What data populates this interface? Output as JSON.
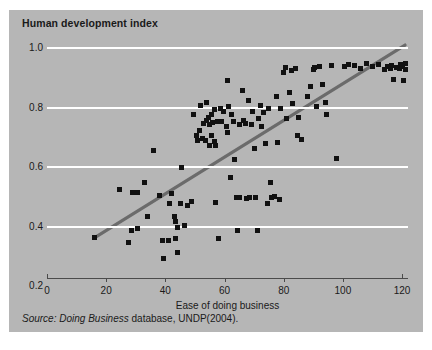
{
  "figure": {
    "title": "Human development index",
    "source_italic": "Source: Doing Business",
    "source_roman": " database, UNDP(2004).",
    "panel_color": "#b6b6b6",
    "grid_color": "#ffffff",
    "marker_color": "#111111",
    "trendline_color": "#6b6b6b",
    "axis_color": "#4b4b4b"
  },
  "chart_data": {
    "type": "scatter",
    "title": "Human development index",
    "xlabel": "Ease of doing business",
    "ylabel": "Human development index",
    "xlim": [
      0,
      122
    ],
    "ylim": [
      0.2,
      1.02
    ],
    "xticks": [
      0,
      20,
      40,
      60,
      80,
      100,
      120
    ],
    "xtick_labels": [
      "0",
      "20",
      "40",
      "60",
      "80",
      "100",
      "120"
    ],
    "yticks": [
      0.2,
      0.4,
      0.6,
      0.8,
      1.0
    ],
    "ytick_labels": [
      "0.2",
      "0.4",
      "0.6",
      "0.8",
      "1.0"
    ],
    "grid": "horizontal",
    "legend": "none",
    "annotation": "Source: Doing Business database, UNDP(2004).",
    "trendline": {
      "type": "linear",
      "x": [
        16,
        121
      ],
      "y": [
        0.362,
        1.01
      ]
    },
    "series": [
      {
        "name": "Countries",
        "marker": "square",
        "points": [
          [
            16.0,
            0.362
          ],
          [
            24.5,
            0.525
          ],
          [
            27.5,
            0.345
          ],
          [
            28.5,
            0.388
          ],
          [
            29.0,
            0.513
          ],
          [
            30.5,
            0.515
          ],
          [
            30.5,
            0.392
          ],
          [
            33.0,
            0.548
          ],
          [
            34.0,
            0.432
          ],
          [
            36.0,
            0.655
          ],
          [
            38.0,
            0.505
          ],
          [
            39.0,
            0.352
          ],
          [
            39.5,
            0.292
          ],
          [
            41.0,
            0.352
          ],
          [
            41.5,
            0.478
          ],
          [
            42.0,
            0.512
          ],
          [
            43.0,
            0.432
          ],
          [
            43.5,
            0.418
          ],
          [
            43.5,
            0.358
          ],
          [
            44.0,
            0.398
          ],
          [
            44.0,
            0.312
          ],
          [
            45.0,
            0.478
          ],
          [
            45.5,
            0.598
          ],
          [
            46.5,
            0.402
          ],
          [
            47.5,
            0.472
          ],
          [
            49.0,
            0.483
          ],
          [
            49.5,
            0.775
          ],
          [
            50.5,
            0.705
          ],
          [
            51.0,
            0.688
          ],
          [
            51.5,
            0.722
          ],
          [
            52.0,
            0.808
          ],
          [
            52.5,
            0.695
          ],
          [
            53.0,
            0.745
          ],
          [
            53.5,
            0.688
          ],
          [
            54.0,
            0.818
          ],
          [
            54.0,
            0.755
          ],
          [
            54.5,
            0.765
          ],
          [
            55.0,
            0.742
          ],
          [
            55.0,
            0.672
          ],
          [
            55.5,
            0.705
          ],
          [
            55.5,
            0.778
          ],
          [
            56.0,
            0.748
          ],
          [
            56.5,
            0.685
          ],
          [
            56.5,
            0.792
          ],
          [
            57.0,
            0.672
          ],
          [
            57.0,
            0.482
          ],
          [
            57.5,
            0.752
          ],
          [
            58.0,
            0.358
          ],
          [
            58.5,
            0.795
          ],
          [
            59.0,
            0.752
          ],
          [
            59.5,
            0.788
          ],
          [
            60.5,
            0.735
          ],
          [
            61.0,
            0.892
          ],
          [
            61.0,
            0.715
          ],
          [
            61.5,
            0.805
          ],
          [
            62.0,
            0.565
          ],
          [
            62.5,
            0.778
          ],
          [
            63.0,
            0.752
          ],
          [
            63.5,
            0.625
          ],
          [
            64.0,
            0.498
          ],
          [
            64.5,
            0.388
          ],
          [
            65.0,
            0.742
          ],
          [
            65.0,
            0.498
          ],
          [
            66.0,
            0.858
          ],
          [
            66.5,
            0.755
          ],
          [
            67.0,
            0.745
          ],
          [
            67.5,
            0.495
          ],
          [
            68.0,
            0.822
          ],
          [
            68.5,
            0.497
          ],
          [
            69.0,
            0.742
          ],
          [
            69.5,
            0.785
          ],
          [
            70.0,
            0.662
          ],
          [
            70.5,
            0.497
          ],
          [
            71.0,
            0.388
          ],
          [
            71.5,
            0.762
          ],
          [
            72.0,
            0.808
          ],
          [
            72.5,
            0.735
          ],
          [
            73.0,
            0.782
          ],
          [
            74.0,
            0.678
          ],
          [
            74.5,
            0.478
          ],
          [
            75.0,
            0.795
          ],
          [
            75.5,
            0.548
          ],
          [
            76.0,
            0.498
          ],
          [
            77.0,
            0.502
          ],
          [
            77.5,
            0.838
          ],
          [
            78.0,
            0.682
          ],
          [
            78.5,
            0.492
          ],
          [
            79.0,
            0.795
          ],
          [
            80.0,
            0.918
          ],
          [
            80.5,
            0.935
          ],
          [
            81.0,
            0.762
          ],
          [
            82.0,
            0.852
          ],
          [
            82.5,
            0.925
          ],
          [
            83.0,
            0.812
          ],
          [
            84.0,
            0.932
          ],
          [
            84.5,
            0.705
          ],
          [
            85.0,
            0.768
          ],
          [
            86.0,
            0.692
          ],
          [
            88.0,
            0.838
          ],
          [
            89.0,
            0.872
          ],
          [
            90.0,
            0.928
          ],
          [
            90.5,
            0.935
          ],
          [
            91.0,
            0.802
          ],
          [
            92.0,
            0.938
          ],
          [
            93.0,
            0.878
          ],
          [
            94.0,
            0.818
          ],
          [
            94.5,
            0.775
          ],
          [
            96.0,
            0.942
          ],
          [
            98.0,
            0.628
          ],
          [
            100.5,
            0.938
          ],
          [
            102.0,
            0.945
          ],
          [
            104.0,
            0.942
          ],
          [
            106.0,
            0.932
          ],
          [
            108.0,
            0.948
          ],
          [
            110.0,
            0.938
          ],
          [
            112.0,
            0.945
          ],
          [
            114.0,
            0.928
          ],
          [
            115.0,
            0.938
          ],
          [
            116.0,
            0.932
          ],
          [
            116.5,
            0.942
          ],
          [
            117.0,
            0.895
          ],
          [
            118.0,
            0.935
          ],
          [
            119.0,
            0.932
          ],
          [
            119.5,
            0.945
          ],
          [
            120.0,
            0.938
          ],
          [
            120.5,
            0.892
          ],
          [
            121.0,
            0.928
          ],
          [
            121.0,
            0.948
          ]
        ]
      }
    ]
  }
}
